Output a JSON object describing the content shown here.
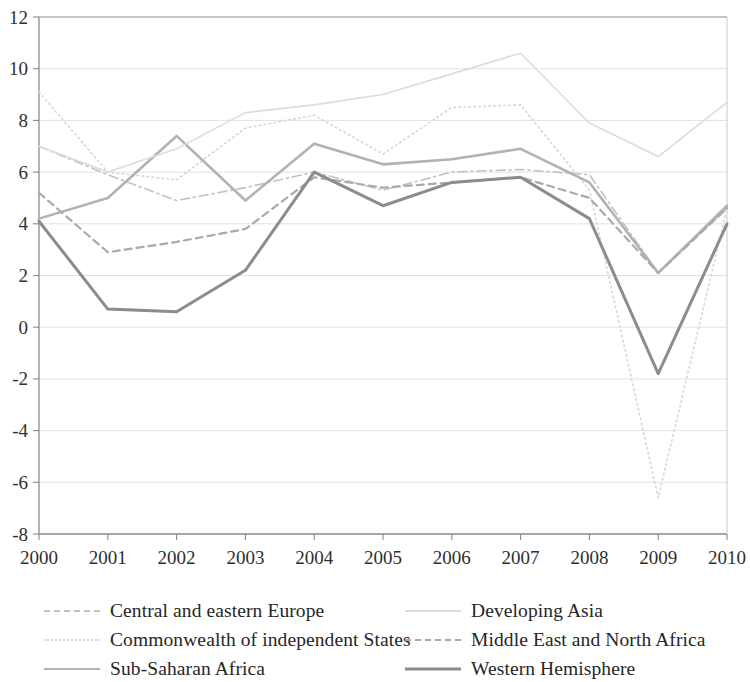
{
  "chart_data": {
    "type": "line",
    "title": "",
    "subtitle": "",
    "xlabel": "",
    "ylabel": "",
    "grid": true,
    "legend_position": "bottom",
    "x": [
      2000,
      2001,
      2002,
      2003,
      2004,
      2005,
      2006,
      2007,
      2008,
      2009,
      2010
    ],
    "xtick_labels": [
      "2000",
      "2001",
      "2002",
      "2003",
      "2004",
      "2005",
      "2006",
      "2007",
      "2008",
      "2009",
      "2010"
    ],
    "xlim": [
      2000,
      2010
    ],
    "ylim": [
      -8,
      12
    ],
    "ytick_labels": [
      "12",
      "10",
      "8",
      "6",
      "4",
      "2",
      "0",
      "-2",
      "-4",
      "-6",
      "-8"
    ],
    "ytick_values": [
      12,
      10,
      8,
      6,
      4,
      2,
      0,
      -2,
      -4,
      -6,
      -8
    ],
    "series": [
      {
        "name": "Central and eastern Europe",
        "style": "dash-dot",
        "color": "#c2c2c2",
        "width": 1.6,
        "values": [
          7.0,
          5.9,
          4.9,
          5.4,
          6.0,
          5.3,
          6.0,
          6.1,
          5.9,
          2.1,
          4.6
        ]
      },
      {
        "name": "Commonwealth of independent States",
        "style": "dotted",
        "color": "#d6d6d6",
        "width": 1.6,
        "values": [
          9.1,
          6.0,
          5.7,
          7.7,
          8.2,
          6.7,
          8.5,
          8.6,
          5.3,
          -6.6,
          4.6
        ]
      },
      {
        "name": "Sub-Saharan Africa",
        "style": "solid",
        "color": "#b2b2b2",
        "width": 2.6,
        "values": [
          4.2,
          5.0,
          7.4,
          4.9,
          7.1,
          6.3,
          6.5,
          6.9,
          5.6,
          2.1,
          4.7
        ]
      },
      {
        "name": "Developing Asia",
        "style": "solid-faint",
        "color": "#dcdcdc",
        "width": 1.6,
        "values": [
          7.0,
          6.0,
          6.9,
          8.3,
          8.6,
          9.0,
          9.8,
          10.6,
          7.9,
          6.6,
          8.7
        ]
      },
      {
        "name": "Middle East and North Africa",
        "style": "dashed",
        "color": "#aaaaaa",
        "width": 2.2,
        "values": [
          5.2,
          2.9,
          3.3,
          3.8,
          5.8,
          5.4,
          5.6,
          5.8,
          5.0,
          2.1,
          4.6
        ]
      },
      {
        "name": "Western Hemisphere",
        "style": "solid-dark",
        "color": "#8c8c8c",
        "width": 3.0,
        "values": [
          4.1,
          0.7,
          0.6,
          2.2,
          6.0,
          4.7,
          5.6,
          5.8,
          4.2,
          -1.8,
          4.0
        ]
      }
    ]
  },
  "axes": {
    "y_ticks": [
      "12",
      "10",
      "8",
      "6",
      "4",
      "2",
      "0",
      "-2",
      "-4",
      "-6",
      "-8"
    ],
    "x_ticks": [
      "2000",
      "2001",
      "2002",
      "2003",
      "2004",
      "2005",
      "2006",
      "2007",
      "2008",
      "2009",
      "2010"
    ]
  },
  "legend": {
    "entries": [
      {
        "label": "Central and eastern Europe",
        "column": "left",
        "row": 1
      },
      {
        "label": "Developing Asia",
        "column": "right",
        "row": 1
      },
      {
        "label": "Commonwealth of independent States",
        "column": "left",
        "row": 2
      },
      {
        "label": "Middle East and North Africa",
        "column": "right",
        "row": 2
      },
      {
        "label": "Sub-Saharan Africa",
        "column": "left",
        "row": 3
      },
      {
        "label": "Western Hemisphere",
        "column": "right",
        "row": 3
      }
    ]
  }
}
